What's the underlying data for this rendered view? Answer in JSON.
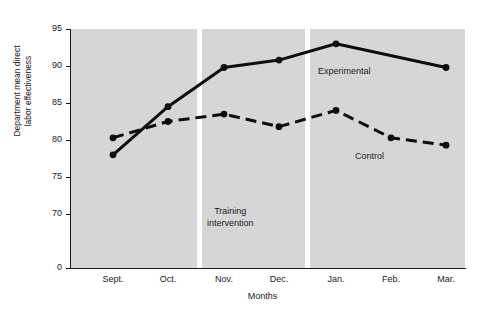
{
  "chart_data": {
    "type": "line",
    "title": "",
    "xlabel": "Months",
    "ylabel": "Department mean direct labor effectiveness",
    "categories": [
      "Sept.",
      "Oct.",
      "Nov.",
      "Dec.",
      "Jan.",
      "Feb.",
      "Mar."
    ],
    "ylim": [
      0,
      95
    ],
    "ytick_labels": [
      "0",
      "70",
      "75",
      "80",
      "85",
      "90",
      "95"
    ],
    "ytick_values": [
      0,
      70,
      75,
      80,
      85,
      90,
      95
    ],
    "grid": false,
    "legend": "inline-labels",
    "series": [
      {
        "name": "Experimental",
        "style": "solid",
        "color": "#0d0d0d",
        "values": [
          78.0,
          84.5,
          89.8,
          90.8,
          93.0,
          null,
          89.8
        ]
      },
      {
        "name": "Control",
        "style": "dashed",
        "color": "#0d0d0d",
        "values": [
          80.3,
          82.5,
          83.5,
          81.8,
          84.0,
          80.3,
          79.3
        ]
      }
    ],
    "annotations": [
      {
        "text": "Training\nintervention",
        "near_category": "Nov."
      },
      {
        "text": "Experimental",
        "near_category": "Jan."
      },
      {
        "text": "Control",
        "near_category": "Feb."
      }
    ],
    "phase_dividers": [
      {
        "after_category": "Oct."
      },
      {
        "after_category": "Dec."
      }
    ],
    "axis_break": true,
    "plot_background": "#d6d6d6"
  },
  "labels": {
    "y_axis_line1": "Department mean direct",
    "y_axis_line2": "labor effectiveness",
    "x_axis": "Months",
    "training": "Training\nintervention",
    "experimental": "Experimental",
    "control": "Control",
    "y0": "0",
    "y70": "70",
    "y75": "75",
    "y80": "80",
    "y85": "85",
    "y90": "90",
    "y95": "95",
    "x_sept": "Sept.",
    "x_oct": "Oct.",
    "x_nov": "Nov.",
    "x_dec": "Dec.",
    "x_jan": "Jan.",
    "x_feb": "Feb.",
    "x_mar": "Mar."
  }
}
